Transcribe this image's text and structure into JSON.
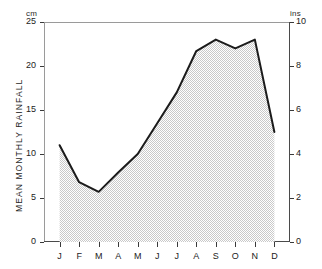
{
  "chart_data": {
    "type": "area",
    "title": "",
    "xlabel": "",
    "ylabel": "MEAN MONTHLY RAINFALL",
    "categories": [
      "J",
      "F",
      "M",
      "A",
      "M",
      "J",
      "J",
      "A",
      "S",
      "O",
      "N",
      "D"
    ],
    "month_names": [
      "January",
      "February",
      "March",
      "April",
      "May",
      "June",
      "July",
      "August",
      "September",
      "October",
      "November",
      "December"
    ],
    "values": [
      11.0,
      6.8,
      5.7,
      7.9,
      10.0,
      13.5,
      17.0,
      21.7,
      23.0,
      22.0,
      23.0,
      12.5
    ],
    "values_inches": [
      4.4,
      2.7,
      2.3,
      3.2,
      4.0,
      5.4,
      6.8,
      8.7,
      9.2,
      8.8,
      9.2,
      5.0
    ],
    "left_axis": {
      "unit": "cm",
      "ticks": [
        25,
        20,
        15,
        10,
        5,
        0
      ],
      "ylim": [
        0,
        25
      ]
    },
    "right_axis": {
      "unit": "ins",
      "ticks": [
        10,
        8,
        6,
        4,
        2,
        0
      ],
      "ylim": [
        0,
        10
      ]
    },
    "grid": false,
    "legend": null,
    "line_color": "#1b1b1b",
    "fill_color": "#e0e0e0"
  }
}
